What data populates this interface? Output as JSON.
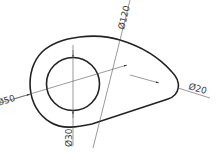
{
  "drawing": {
    "type": "technical-drawing",
    "colors": {
      "outline": "#222222",
      "dimension": "#555555",
      "text": "#3a3a3a",
      "background": "#ffffff"
    },
    "dimensions": {
      "outer_left_arc": "Ø50",
      "tangent_arc": "Ø120",
      "right_arc": "Ø20",
      "inner_circle": "Ø30"
    }
  }
}
